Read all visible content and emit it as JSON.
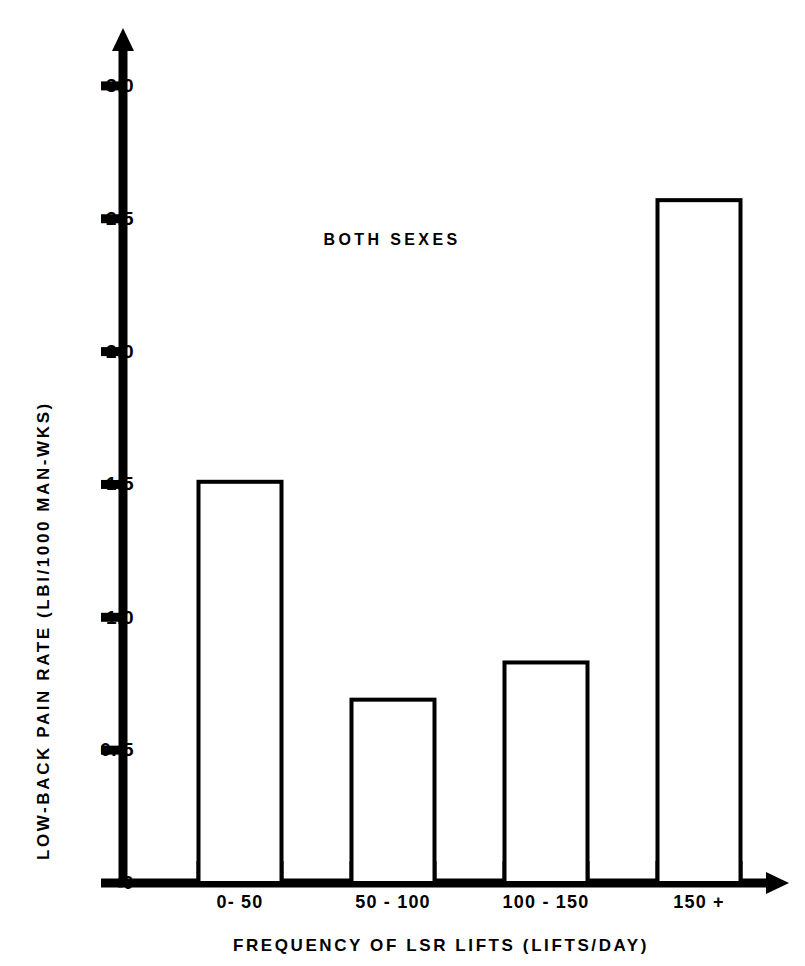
{
  "chart_data": {
    "type": "bar",
    "title": "",
    "annotation": "BOTH  SEXES",
    "categories": [
      "0- 50",
      "50 - 100",
      "100 - 150",
      "150 +"
    ],
    "values": [
      1.51,
      0.69,
      0.83,
      2.57
    ],
    "xlabel": "FREQUENCY OF LSR LIFTS (LIFTS/DAY)",
    "ylabel": "LOW-BACK PAIN RATE (LBI/1000 MAN-WKS)",
    "ylim": [
      0,
      3.15
    ],
    "xlim": [
      0,
      4
    ],
    "ytick_labels": [
      "0",
      "0. 5",
      "1.0",
      "1.5",
      "2.0",
      "2.5",
      "3.0"
    ],
    "ytick_values": [
      0,
      0.5,
      1.0,
      1.5,
      2.0,
      2.5,
      3.0
    ],
    "grid": false,
    "legend": null,
    "series": [
      {
        "name": "Both sexes",
        "values": [
          1.51,
          0.69,
          0.83,
          2.57
        ]
      }
    ],
    "bar_style": {
      "fill": "#ffffff",
      "edge_color": "#000000",
      "edge_width": 4
    },
    "axis_color": "#000000",
    "background_color": "#ffffff",
    "axis_arrows": true
  },
  "figure": {
    "caption": ""
  }
}
